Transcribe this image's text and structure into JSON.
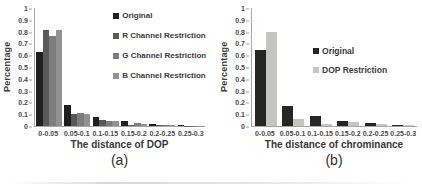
{
  "figure": {
    "background": "#ffffff",
    "axis_color": "#a5a5a5",
    "text_color": "#3c3c3c"
  },
  "chart_data": [
    {
      "type": "bar",
      "caption": "(a)",
      "xlabel": "The distance of DOP",
      "ylabel": "Percentage",
      "y_axis": {
        "min": 0,
        "max": 1,
        "step": 0.1
      },
      "grid": false,
      "legend_position": "upper-right-inside",
      "categories": [
        "0-0.05",
        "0.05-0.1",
        "0.1-0.15",
        "0.15-0.2",
        "0.2-0.25",
        "0.25-0.3"
      ],
      "series": [
        {
          "name": "Original",
          "color": "#1f1f1f",
          "values": [
            0.63,
            0.18,
            0.08,
            0.04,
            0.018,
            0.008
          ]
        },
        {
          "name": "R Channel Restriction",
          "color": "#595959",
          "values": [
            0.81,
            0.1,
            0.05,
            0.012,
            0.008,
            0.004
          ]
        },
        {
          "name": "G Channel Restriction",
          "color": "#7d7d7d",
          "values": [
            0.76,
            0.11,
            0.045,
            0.028,
            0.008,
            0.004
          ]
        },
        {
          "name": "B Channel Restriction",
          "color": "#929292",
          "values": [
            0.81,
            0.1,
            0.045,
            0.015,
            0.007,
            0.004
          ]
        }
      ]
    },
    {
      "type": "bar",
      "caption": "(b)",
      "xlabel": "The distance of chrominance",
      "ylabel": "Percentage",
      "y_axis": {
        "min": 0,
        "max": 1,
        "step": 0.1
      },
      "grid": false,
      "legend_position": "center-right-inside",
      "categories": [
        "0-0.05",
        "0.05-0.1",
        "0.1-0.15",
        "0.15-0.2",
        "0.2-0.25",
        "0.25-0.3"
      ],
      "series": [
        {
          "name": "Original",
          "color": "#262626",
          "values": [
            0.64,
            0.17,
            0.085,
            0.045,
            0.025,
            0.01
          ]
        },
        {
          "name": "DOP Restriction",
          "color": "#c6c6c0",
          "values": [
            0.8,
            0.06,
            0.02,
            0.035,
            0.02,
            0.008
          ]
        }
      ]
    }
  ]
}
